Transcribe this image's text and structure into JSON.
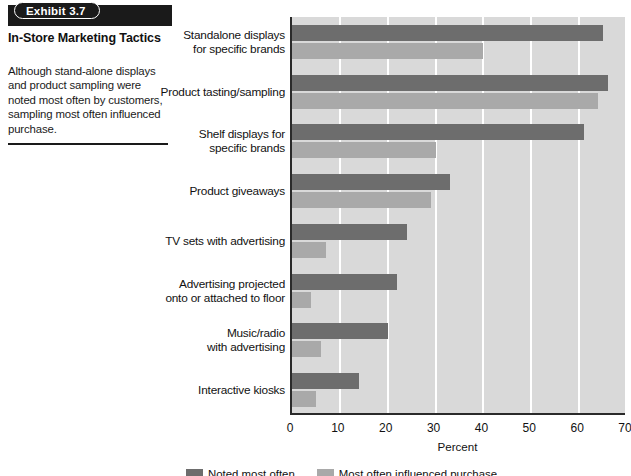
{
  "exhibit": {
    "badge": "Exhibit 3.7",
    "title": "In-Store Marketing Tactics",
    "description": "Although stand-alone displays and product sampling were noted most often by customers, sampling most often influenced purchase."
  },
  "colors": {
    "series_1": "#6d6d6d",
    "series_2": "#a9a9a9",
    "plot_background": "#d9d9d9",
    "gridline": "#ffffff",
    "axis": "#2a2a2a",
    "banner": "#1a1a1a"
  },
  "chart_data": {
    "type": "bar",
    "orientation": "horizontal",
    "title": "In-Store Marketing Tactics",
    "xlabel": "Percent",
    "ylabel": "",
    "xlim": [
      0,
      70
    ],
    "xticks": [
      0,
      10,
      20,
      30,
      40,
      50,
      60,
      70
    ],
    "grid": true,
    "legend_position": "bottom",
    "categories": [
      "Standalone displays for specific brands",
      "Product tasting/sampling",
      "Shelf displays for specific brands",
      "Product giveaways",
      "TV sets with advertising",
      "Advertising projected onto or attached to floor",
      "Music/radio with advertising",
      "Interactive kiosks"
    ],
    "series": [
      {
        "name": "Noted most often",
        "color": "#6d6d6d",
        "values": [
          65,
          66,
          61,
          33,
          24,
          22,
          20,
          14
        ]
      },
      {
        "name": "Most often influenced purchase",
        "color": "#a9a9a9",
        "values": [
          40,
          64,
          30,
          29,
          7,
          4,
          6,
          5
        ]
      }
    ]
  },
  "axis": {
    "x_title": "Percent",
    "tick_labels": [
      "0",
      "10",
      "20",
      "30",
      "40",
      "50",
      "60",
      "70"
    ]
  },
  "category_labels": [
    [
      "Standalone displays",
      "for specific brands"
    ],
    [
      "Product tasting/sampling"
    ],
    [
      "Shelf displays for",
      "specific brands"
    ],
    [
      "Product giveaways"
    ],
    [
      "TV sets with advertising"
    ],
    [
      "Advertising projected",
      "onto or attached to floor"
    ],
    [
      "Music/radio",
      "with advertising"
    ],
    [
      "Interactive kiosks"
    ]
  ]
}
